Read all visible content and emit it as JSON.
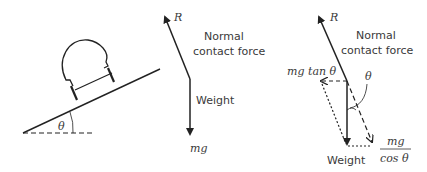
{
  "left_diagram": {
    "angle_label": "θ"
  },
  "middle_diagram": {
    "reaction_label": "R",
    "normal_line1": "Normal",
    "normal_line2": "contact force",
    "weight_label": "Weight",
    "mg_label": "mg"
  },
  "right_diagram": {
    "reaction_label": "R",
    "normal_line1": "Normal",
    "normal_line2": "contact force",
    "tan_label": "mg tan θ",
    "angle_label": "θ",
    "weight_label": "Weight",
    "frac_numerator": "mg",
    "frac_denominator": "cos θ"
  },
  "colors": {
    "stroke": "#222222",
    "text": "#3a3a3a"
  }
}
